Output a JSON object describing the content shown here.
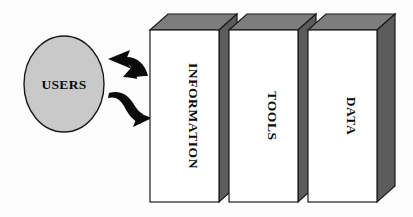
{
  "diagram": {
    "background_color": "#fdfdfd",
    "actor": {
      "label": "USERS",
      "shape": "ellipse",
      "fill_color": "#c9c9c9",
      "stroke_color": "#1a1a1a",
      "center_x": 64,
      "center_y": 84,
      "radius_x": 40,
      "radius_y": 48
    },
    "arrows": [
      {
        "name": "arrow-to-users",
        "label": "",
        "direction": "left",
        "description": "curved arrow pointing from the boxes back toward USERS",
        "color": "#0b0b0b"
      },
      {
        "name": "arrow-to-boxes",
        "label": "",
        "direction": "right",
        "description": "curved arrow pointing from USERS toward the boxes",
        "color": "#0b0b0b"
      }
    ],
    "blocks": [
      {
        "label": "INFORMATION",
        "front_fill": "#ffffff",
        "top_fill": "#7d7d7d",
        "side_fill": "#5c5c5c",
        "stroke_color": "#1a1a1a",
        "text_orientation": "vertical-clockwise",
        "front_x": 150,
        "front_y": 30,
        "front_width": 69,
        "front_height": 172,
        "depth_x": 18,
        "depth_y": 16
      },
      {
        "label": "TOOLS",
        "front_fill": "#ffffff",
        "top_fill": "#7d7d7d",
        "side_fill": "#5c5c5c",
        "stroke_color": "#1a1a1a",
        "text_orientation": "vertical-clockwise",
        "front_x": 229,
        "front_y": 30,
        "front_width": 69,
        "front_height": 172,
        "depth_x": 18,
        "depth_y": 16
      },
      {
        "label": "DATA",
        "front_fill": "#ffffff",
        "top_fill": "#7d7d7d",
        "side_fill": "#5c5c5c",
        "stroke_color": "#1a1a1a",
        "text_orientation": "vertical-clockwise",
        "front_x": 308,
        "front_y": 30,
        "front_width": 69,
        "front_height": 172,
        "depth_x": 18,
        "depth_y": 16
      }
    ]
  }
}
